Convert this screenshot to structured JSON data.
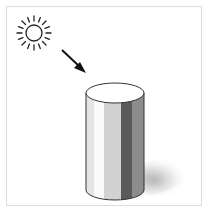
{
  "diagram": {
    "elements": [
      {
        "name": "sun",
        "type": "light-source"
      },
      {
        "name": "arrow",
        "type": "light-direction"
      },
      {
        "name": "cylinder",
        "type": "shaded-object"
      },
      {
        "name": "cast-shadow",
        "type": "shadow"
      }
    ],
    "colors": {
      "frame": "#dcdcdc",
      "outline": "#333333",
      "band_light": "#e4e4e4",
      "band_highlight": "#fafafa",
      "band_mid_light": "#d2d2d2",
      "band_dark": "#5a5a5a",
      "band_mid": "#8c8c8c",
      "shadow": "#bdbdbd"
    }
  }
}
